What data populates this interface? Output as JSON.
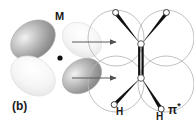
{
  "figure": {
    "panel_label": "(b)",
    "caption_kind": "orbital-interaction-diagram",
    "metal_label": "M",
    "orbital_label": "π",
    "orbital_label_star": "*",
    "hydrogen_label_left": "H",
    "hydrogen_label_right": "H",
    "icon_names": {
      "metal_orbital": "metal-d-orbital-icon",
      "pi_star_orbital": "pi-star-orbital-icon",
      "donation_arrow": "right-arrow-icon",
      "metal_center": "metal-center-dot-icon",
      "carbon_atom": "carbon-atom-icon",
      "hydrogen_atom": "hydrogen-atom-icon"
    },
    "colors": {
      "lobe_dark_fill": "#8e8e8e",
      "lobe_light_fill": "#ebebeb",
      "lobe_outline": "#b3b3b3",
      "circle_outline": "#b9b9b9",
      "bond_black": "#111111",
      "arrow": "#5a5a5a",
      "text": "#1a1a1a",
      "background": "#ffffff"
    },
    "arrows": [
      {
        "name": "upper-donation-arrow",
        "x1": 72,
        "y1": 42,
        "x2": 117,
        "y2": 42
      },
      {
        "name": "lower-donation-arrow",
        "x1": 72,
        "y1": 78,
        "x2": 117,
        "y2": 78
      }
    ],
    "metal_orbital_lobes": [
      {
        "name": "upper-left-lobe",
        "shade": "dark"
      },
      {
        "name": "lower-left-lobe",
        "shade": "light"
      },
      {
        "name": "upper-right-lobe",
        "shade": "light"
      },
      {
        "name": "lower-right-lobe",
        "shade": "dark"
      }
    ],
    "pi_star_lobes": [
      {
        "name": "top-left-lobe"
      },
      {
        "name": "top-right-lobe"
      },
      {
        "name": "bottom-left-lobe"
      },
      {
        "name": "bottom-right-lobe"
      }
    ],
    "atoms": [
      {
        "name": "carbon-top",
        "kind": "C"
      },
      {
        "name": "carbon-bottom",
        "kind": "C"
      },
      {
        "name": "hydrogen-top-left",
        "kind": "H"
      },
      {
        "name": "hydrogen-top-right",
        "kind": "H"
      },
      {
        "name": "hydrogen-bottom-left",
        "kind": "H"
      },
      {
        "name": "hydrogen-bottom-right",
        "kind": "H"
      }
    ]
  }
}
